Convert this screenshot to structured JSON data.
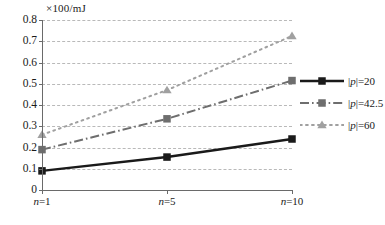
{
  "chart_data": {
    "type": "line",
    "title": "",
    "subtitle": "",
    "unit_label": "×100/mJ",
    "xlabel": "",
    "ylabel": "",
    "categories": [
      "n=1",
      "n=5",
      "n=10"
    ],
    "x": [
      1,
      5,
      10
    ],
    "x_positions_fraction": [
      0.0,
      0.5,
      1.0
    ],
    "xtick_labels": [
      "n=1",
      "n=5",
      "n=10"
    ],
    "ylim": [
      0,
      0.8
    ],
    "ytick_labels": [
      "0",
      "0.1",
      "0.2",
      "0.3",
      "0.4",
      "0.5",
      "0.6",
      "0.7",
      "0.8"
    ],
    "ytick_values": [
      0,
      0.1,
      0.2,
      0.3,
      0.4,
      0.5,
      0.6,
      0.7,
      0.8
    ],
    "grid": true,
    "grid_style": "dashed-horizontal",
    "legend_position": "right",
    "series": [
      {
        "name": "|p|=20",
        "label_prefix": "|",
        "label_var": "p",
        "label_suffix": "|=20",
        "values": [
          0.09,
          0.155,
          0.24
        ],
        "color": "#1a1a1a",
        "line_style": "solid",
        "marker": "square"
      },
      {
        "name": "|p|=42.5",
        "label_prefix": "|",
        "label_var": "p",
        "label_suffix": "|=42.5",
        "values": [
          0.19,
          0.335,
          0.515
        ],
        "color": "#6e6e6e",
        "line_style": "dash-dot",
        "marker": "square"
      },
      {
        "name": "|p|=60",
        "label_prefix": "|",
        "label_var": "p",
        "label_suffix": "|=60",
        "values": [
          0.26,
          0.47,
          0.725
        ],
        "color": "#a0a0a0",
        "line_style": "dotted",
        "marker": "triangle"
      }
    ]
  },
  "colors": {
    "axis": "#6a6a6a",
    "grid": "#b9b9b9",
    "background": "#ffffff",
    "text": "#1a1a1a"
  }
}
